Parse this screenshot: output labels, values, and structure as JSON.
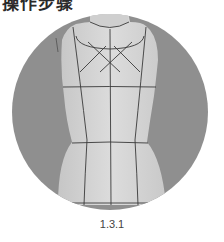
{
  "page": {
    "title": "操作步骤",
    "figure": {
      "description": "dress form with style lines taped on bodice",
      "caption": "1.3.1"
    }
  },
  "colors": {
    "background_circle": "#8f8f8f",
    "form_body": "#d4d4d4",
    "tape_lines": "#3a3a3a"
  }
}
